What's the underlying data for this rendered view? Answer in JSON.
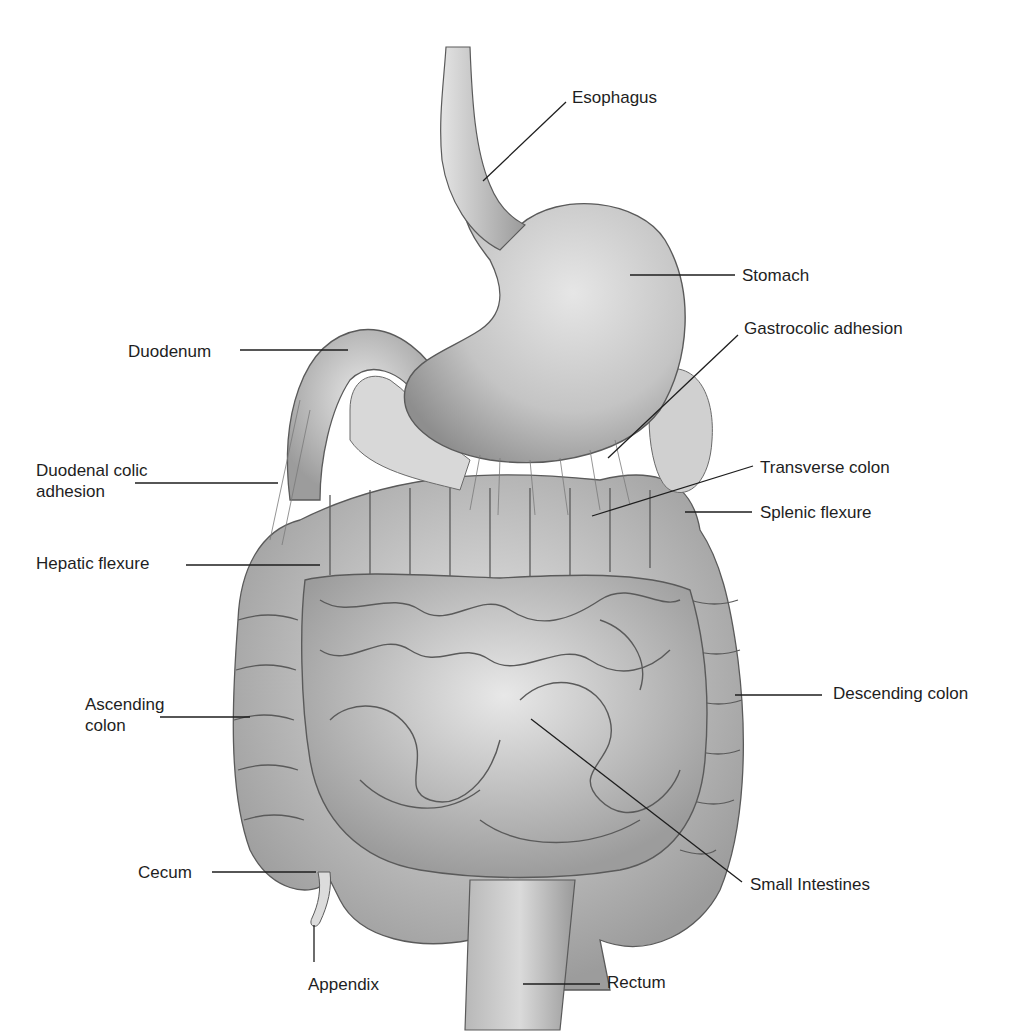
{
  "diagram": {
    "colors": {
      "background": "#ffffff",
      "organ_fill": "#bdbdbd",
      "organ_light": "#dedede",
      "organ_dark": "#8a8a8a",
      "outline": "#5a5a5a",
      "leader": "#1e1e1e",
      "text": "#1e1e1e"
    },
    "labels": [
      {
        "id": "esophagus",
        "text": "Esophagus",
        "x": 572,
        "y": 87,
        "line": [
          [
            566,
            102
          ],
          [
            483,
            181
          ]
        ]
      },
      {
        "id": "stomach",
        "text": "Stomach",
        "x": 742,
        "y": 265,
        "line": [
          [
            630,
            275
          ],
          [
            735,
            275
          ]
        ]
      },
      {
        "id": "gastrocolic-adhesion",
        "text": "Gastrocolic adhesion",
        "x": 744,
        "y": 318,
        "line": [
          [
            738,
            335
          ],
          [
            608,
            458
          ]
        ]
      },
      {
        "id": "duodenum",
        "text": "Duodenum",
        "x": 128,
        "y": 341,
        "line": [
          [
            240,
            350
          ],
          [
            348,
            350
          ]
        ]
      },
      {
        "id": "duodenal-colic-adhesion",
        "text": "Duodenal colic\nadhesion",
        "x": 36,
        "y": 460,
        "line": [
          [
            135,
            483
          ],
          [
            278,
            483
          ]
        ]
      },
      {
        "id": "transverse-colon",
        "text": "Transverse colon",
        "x": 760,
        "y": 457,
        "line": [
          [
            753,
            466
          ],
          [
            592,
            516
          ]
        ]
      },
      {
        "id": "splenic-flexure",
        "text": "Splenic flexure",
        "x": 760,
        "y": 502,
        "line": [
          [
            685,
            512
          ],
          [
            752,
            512
          ]
        ]
      },
      {
        "id": "hepatic-flexure",
        "text": "Hepatic flexure",
        "x": 36,
        "y": 553,
        "line": [
          [
            186,
            565
          ],
          [
            320,
            565
          ]
        ]
      },
      {
        "id": "ascending-colon",
        "text": "Ascending\ncolon",
        "x": 85,
        "y": 694,
        "line": [
          [
            160,
            717
          ],
          [
            250,
            717
          ]
        ]
      },
      {
        "id": "descending-colon",
        "text": "Descending colon",
        "x": 833,
        "y": 683,
        "line": [
          [
            735,
            695
          ],
          [
            822,
            695
          ]
        ]
      },
      {
        "id": "small-intestines",
        "text": "Small Intestines",
        "x": 750,
        "y": 874,
        "line": [
          [
            531,
            719
          ],
          [
            742,
            882
          ]
        ]
      },
      {
        "id": "cecum",
        "text": "Cecum",
        "x": 138,
        "y": 862,
        "line": [
          [
            212,
            872
          ],
          [
            316,
            872
          ]
        ]
      },
      {
        "id": "appendix",
        "text": "Appendix",
        "x": 308,
        "y": 974,
        "line": [
          [
            314,
            925
          ],
          [
            314,
            962
          ]
        ]
      },
      {
        "id": "rectum",
        "text": "Rectum",
        "x": 607,
        "y": 972,
        "line": [
          [
            523,
            984
          ],
          [
            600,
            984
          ]
        ]
      }
    ]
  }
}
